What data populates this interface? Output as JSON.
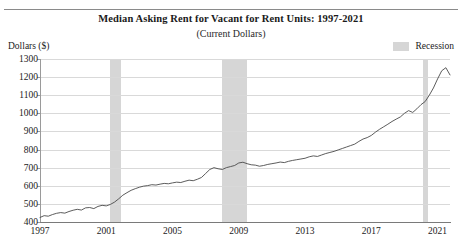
{
  "figure": {
    "title": "Median Asking Rent for Vacant for Rent Units: 1997-2021",
    "subtitle": "(Current Dollars)",
    "ylabel": "Dollars ($)",
    "legend_label": "Recession",
    "recession_color": "#d6d6d6",
    "line_color": "#4a4a4a"
  },
  "chart_data": {
    "type": "line",
    "title": "Median Asking Rent for Vacant for Rent Units: 1997-2021",
    "subtitle": "(Current Dollars)",
    "xlabel": "",
    "ylabel": "Dollars ($)",
    "xlim": [
      1997,
      2021.75
    ],
    "ylim": [
      400,
      1300
    ],
    "ytick_values": [
      400,
      500,
      600,
      700,
      800,
      900,
      1000,
      1100,
      1200,
      1300
    ],
    "ytick_labels": [
      "400",
      "500",
      "600",
      "700",
      "800",
      "900",
      "1000",
      "1100",
      "1200",
      "1300"
    ],
    "xtick_values": [
      1997,
      2001,
      2005,
      2009,
      2013,
      2017,
      2021
    ],
    "xtick_labels": [
      "1997",
      "2001",
      "2005",
      "2009",
      "2013",
      "2017",
      "2021"
    ],
    "grid": "horizontal",
    "legend_position": "top-right",
    "legend_entries": [
      "Recession"
    ],
    "recession_bands": [
      {
        "start": 2001.2,
        "end": 2001.9
      },
      {
        "start": 2008.0,
        "end": 2009.5
      },
      {
        "start": 2020.1,
        "end": 2020.45
      }
    ],
    "series": [
      {
        "name": "Median Asking Rent",
        "color": "#4a4a4a",
        "x": [
          1997.0,
          1997.25,
          1997.5,
          1997.75,
          1998.0,
          1998.25,
          1998.5,
          1998.75,
          1999.0,
          1999.25,
          1999.5,
          1999.75,
          2000.0,
          2000.25,
          2000.5,
          2000.75,
          2001.0,
          2001.25,
          2001.5,
          2001.75,
          2002.0,
          2002.25,
          2002.5,
          2002.75,
          2003.0,
          2003.25,
          2003.5,
          2003.75,
          2004.0,
          2004.25,
          2004.5,
          2004.75,
          2005.0,
          2005.25,
          2005.5,
          2005.75,
          2006.0,
          2006.25,
          2006.5,
          2006.75,
          2007.0,
          2007.25,
          2007.5,
          2007.75,
          2008.0,
          2008.25,
          2008.5,
          2008.75,
          2009.0,
          2009.25,
          2009.5,
          2009.75,
          2010.0,
          2010.25,
          2010.5,
          2010.75,
          2011.0,
          2011.25,
          2011.5,
          2011.75,
          2012.0,
          2012.25,
          2012.5,
          2012.75,
          2013.0,
          2013.25,
          2013.5,
          2013.75,
          2014.0,
          2014.25,
          2014.5,
          2014.75,
          2015.0,
          2015.25,
          2015.5,
          2015.75,
          2016.0,
          2016.25,
          2016.5,
          2016.75,
          2017.0,
          2017.25,
          2017.5,
          2017.75,
          2018.0,
          2018.25,
          2018.5,
          2018.75,
          2019.0,
          2019.25,
          2019.5,
          2019.75,
          2020.0,
          2020.25,
          2020.5,
          2020.75,
          2021.0,
          2021.25,
          2021.5,
          2021.75
        ],
        "y": [
          425,
          435,
          432,
          441,
          448,
          452,
          449,
          458,
          465,
          470,
          466,
          478,
          480,
          474,
          486,
          492,
          489,
          497,
          510,
          528,
          548,
          562,
          575,
          584,
          592,
          598,
          601,
          606,
          604,
          609,
          613,
          611,
          616,
          620,
          618,
          625,
          631,
          628,
          636,
          646,
          668,
          690,
          700,
          694,
          690,
          700,
          706,
          712,
          726,
          730,
          722,
          716,
          714,
          708,
          712,
          718,
          722,
          726,
          731,
          728,
          735,
          740,
          744,
          748,
          752,
          760,
          765,
          762,
          770,
          778,
          784,
          790,
          798,
          806,
          814,
          822,
          830,
          845,
          858,
          866,
          878,
          896,
          912,
          926,
          940,
          955,
          968,
          980,
          1000,
          1015,
          1005,
          1025,
          1048,
          1065,
          1100,
          1140,
          1190,
          1235,
          1252,
          1212
        ]
      }
    ]
  }
}
